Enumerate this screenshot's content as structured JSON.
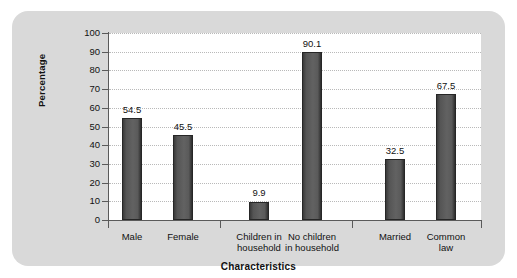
{
  "chart_data": {
    "type": "bar",
    "title": "",
    "subtitle": "",
    "xlabel": "Characteristics",
    "ylabel": "Percentage",
    "ylim": [
      0,
      100
    ],
    "yticks": [
      0,
      10,
      20,
      30,
      40,
      50,
      60,
      70,
      80,
      90,
      100
    ],
    "ytick_labels": [
      "0",
      "10",
      "20",
      "30",
      "40",
      "50",
      "60",
      "70",
      "80",
      "90",
      "100"
    ],
    "grid": true,
    "grid_axis": "y",
    "grid_style": "dotted",
    "legend": false,
    "legend_position": "none",
    "bar_color": "#5a5a5a",
    "bar_edge_color": "#262626",
    "plot_background": "#ffffff",
    "panel_background": "#d9d9d9",
    "categories": [
      "Male",
      "Female",
      "Children in household",
      "No children in household",
      "Married",
      "Common law"
    ],
    "category_lines": [
      [
        "Male"
      ],
      [
        "Female"
      ],
      [
        "Children in",
        "household"
      ],
      [
        "No children",
        "in household"
      ],
      [
        "Married"
      ],
      [
        "Common",
        "law"
      ]
    ],
    "values": [
      54.5,
      45.5,
      9.9,
      90.1,
      32.5,
      67.5
    ],
    "value_labels": [
      "54.5",
      "45.5",
      "9.9",
      "90.1",
      "32.5",
      "67.5"
    ],
    "groups": [
      {
        "name": "Sex",
        "categories": [
          "Male",
          "Female"
        ]
      },
      {
        "name": "Children",
        "categories": [
          "Children in household",
          "No children in household"
        ]
      },
      {
        "name": "Marital status",
        "categories": [
          "Married",
          "Common law"
        ]
      }
    ]
  },
  "layout": {
    "bar_centers_px": [
      120,
      171,
      247,
      300,
      383,
      434
    ],
    "bar_width_px": 20,
    "group_divider_px": [
      208,
      340
    ]
  }
}
